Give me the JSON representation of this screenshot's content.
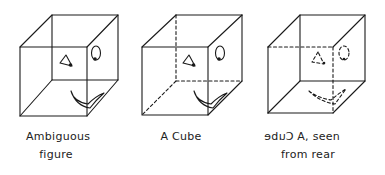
{
  "figures": [
    {
      "id": "ambiguous",
      "caption_line1": "Ambiguous",
      "caption_line2": "figure"
    },
    {
      "id": "cube-front",
      "caption_line1": "A Cube"
    },
    {
      "id": "cube-rear",
      "caption_mirrored_word": "Cube",
      "caption_line1_rest": "A, seen",
      "caption_line2": "from rear"
    }
  ],
  "colors": {
    "ink": "#1a1a1a",
    "background": "#ffffff"
  }
}
